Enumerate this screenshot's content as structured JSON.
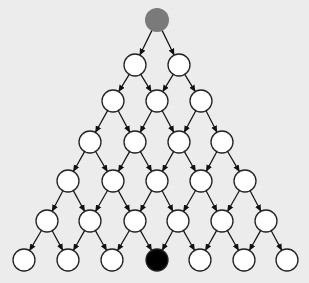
{
  "diagram": {
    "type": "triangular-lattice-graph",
    "background": "#ececec",
    "node_radius": 11,
    "stroke": "#222222",
    "colors": {
      "default": "#ffffff",
      "start": "#7a7a7a",
      "target": "#000000"
    },
    "rows": [
      {
        "y": 20,
        "xs": [
          157
        ]
      },
      {
        "y": 65,
        "xs": [
          135,
          179
        ]
      },
      {
        "y": 101,
        "xs": [
          113,
          157,
          201
        ]
      },
      {
        "y": 142,
        "xs": [
          90,
          135,
          179,
          222
        ]
      },
      {
        "y": 181,
        "xs": [
          68,
          113,
          157,
          201,
          245
        ]
      },
      {
        "y": 221,
        "xs": [
          47,
          90,
          135,
          178,
          222,
          266
        ]
      },
      {
        "y": 260,
        "xs": [
          24,
          68,
          112,
          157,
          200,
          244,
          287
        ]
      }
    ],
    "start_node": {
      "row": 0,
      "index": 0
    },
    "target_node": {
      "row": 6,
      "index": 3
    },
    "edges": "each node points to its two children in the next row (down-left, down-right)"
  }
}
